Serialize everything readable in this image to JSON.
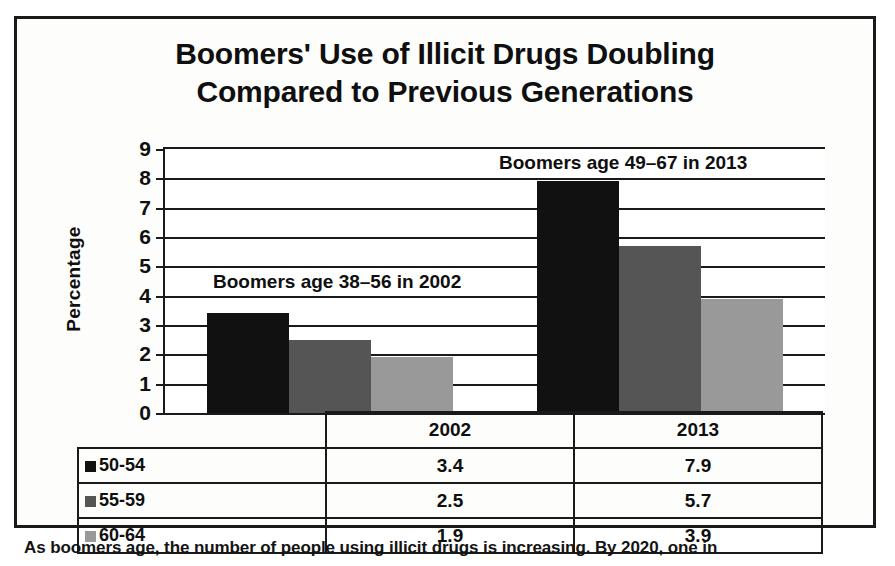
{
  "chart_data": {
    "type": "bar",
    "title": "Boomers' Use of Illicit Drugs Doubling Compared to Previous Generations",
    "title_lines": [
      "Boomers' Use of Illicit Drugs Doubling",
      "Compared to Previous Generations"
    ],
    "xlabel": "",
    "ylabel": "Percentage",
    "ylim": [
      0,
      9
    ],
    "yticks": [
      0,
      1,
      2,
      3,
      4,
      5,
      6,
      7,
      8,
      9
    ],
    "ytick_labels": [
      "0",
      "1",
      "2",
      "3",
      "4",
      "5",
      "6",
      "7",
      "8",
      "9"
    ],
    "grid": true,
    "legend_position": "table-below",
    "categories": [
      "2002",
      "2013"
    ],
    "series": [
      {
        "name": "50-54",
        "color": "#111111",
        "values": [
          3.4,
          7.9
        ]
      },
      {
        "name": "55-59",
        "color": "#555555",
        "values": [
          2.5,
          5.7
        ]
      },
      {
        "name": "60-64",
        "color": "#999999",
        "values": [
          1.9,
          3.9
        ]
      }
    ],
    "annotations": [
      {
        "id": "note_2002",
        "text": "Boomers age 38–56 in 2002"
      },
      {
        "id": "note_2013",
        "text": "Boomers age 49–67 in 2013"
      }
    ]
  },
  "table": {
    "category_header_cells": [
      "2002",
      "2013"
    ],
    "rows": [
      {
        "label": "50-54",
        "swatch": "#111111",
        "values": [
          "3.4",
          "7.9"
        ]
      },
      {
        "label": "55-59",
        "swatch": "#555555",
        "values": [
          "2.5",
          "5.7"
        ]
      },
      {
        "label": "60-64",
        "swatch": "#999999",
        "values": [
          "1.9",
          "3.9"
        ]
      }
    ]
  },
  "caption": {
    "text": "As boomers age, the number of people using illicit drugs is increasing. By 2020, one in"
  }
}
